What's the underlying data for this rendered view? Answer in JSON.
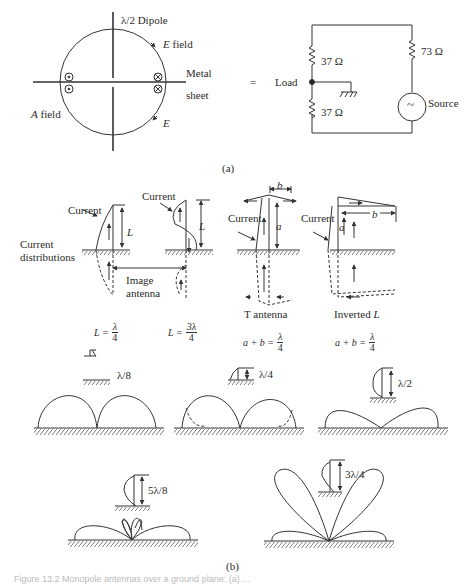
{
  "figure": {
    "part_a": {
      "label": "(a)",
      "dipole_label": "λ/2 Dipole",
      "e_field_label": "E field",
      "e_label": "E",
      "metal_label": "Metal",
      "sheet_label": "sheet",
      "a_field_label": "A field",
      "equals": "=",
      "load_label": "Load",
      "r1": "37 Ω",
      "r2": "37 Ω",
      "r3": "73 Ω",
      "source_label": "Source",
      "source_symbol": "~"
    },
    "part_b": {
      "label": "(b)",
      "current_distributions": [
        "Current",
        "distributions"
      ],
      "current_label": "Current",
      "image_antenna": [
        "Image",
        "antenna"
      ],
      "L_label": "L",
      "a_label": "a",
      "b_label": "b",
      "t_antenna": "T antenna",
      "inverted_l": "Inverted L",
      "eq1": {
        "lhs": "L =",
        "num": "λ",
        "den": "4"
      },
      "eq2": {
        "lhs": "L =",
        "num": "3λ",
        "den": "4"
      },
      "eq3": {
        "lhs": "a + b =",
        "num": "λ",
        "den": "4"
      },
      "eq4": {
        "lhs": "a + b =",
        "num": "λ",
        "den": "4"
      },
      "patterns": [
        {
          "height": "λ/8"
        },
        {
          "height": "λ/4"
        },
        {
          "height": "λ/2"
        },
        {
          "height": "5λ/8"
        },
        {
          "height": "3λ/4"
        }
      ]
    },
    "caption": "Figure 13.2   Monopole antennas over a ground plane: (a) ..."
  }
}
